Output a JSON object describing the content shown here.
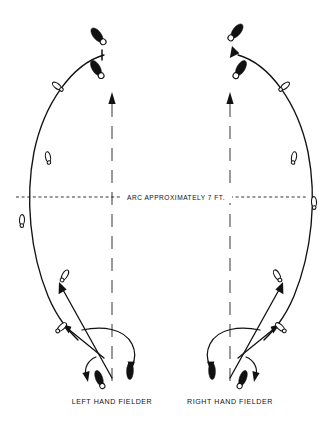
{
  "figure": {
    "background_color": "#ffffff",
    "ink_color": "#111111",
    "width": 325,
    "height": 433
  },
  "annotations": {
    "arc_caption": "ARC APPROXIMATELY 7 FT.",
    "left_panel_label": "LEFT HAND FIELDER",
    "right_panel_label": "RIGHT HAND FIELDER"
  },
  "panels": [
    {
      "id": "left-hand-fielder",
      "label": "LEFT HAND FIELDER",
      "center_x": 112,
      "footprints_filled": 4,
      "footprints_open": 6,
      "direction_arrows": 4
    },
    {
      "id": "right-hand-fielder",
      "label": "RIGHT HAND FIELDER",
      "center_x": 230,
      "footprints_filled": 4,
      "footprints_open": 6,
      "direction_arrows": 4
    }
  ],
  "reference_lines": {
    "horizontal_arc_line_y": 197,
    "horizontal_style": "dashed",
    "vertical_center_style": "dashed",
    "vertical_left_x": 112,
    "vertical_right_x": 230
  }
}
